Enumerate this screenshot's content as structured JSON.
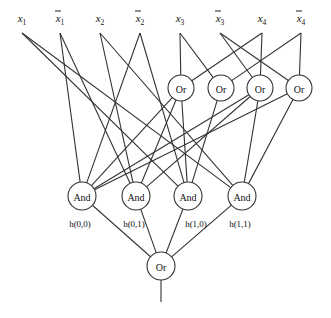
{
  "diagram": {
    "type": "logic-circuit",
    "inputs": [
      {
        "id": "x1",
        "base": "x",
        "sub": "1",
        "negated": false,
        "x": 22
      },
      {
        "id": "nx1",
        "base": "x",
        "sub": "1",
        "negated": true,
        "x": 60
      },
      {
        "id": "x2",
        "base": "x",
        "sub": "2",
        "negated": false,
        "x": 100
      },
      {
        "id": "nx2",
        "base": "x",
        "sub": "2",
        "negated": true,
        "x": 140
      },
      {
        "id": "x3",
        "base": "x",
        "sub": "3",
        "negated": false,
        "x": 180
      },
      {
        "id": "nx3",
        "base": "x",
        "sub": "3",
        "negated": true,
        "x": 220
      },
      {
        "id": "x4",
        "base": "x",
        "sub": "4",
        "negated": false,
        "x": 262
      },
      {
        "id": "nx4",
        "base": "x",
        "sub": "4",
        "negated": true,
        "x": 301
      }
    ],
    "or_gates": [
      {
        "id": "or1",
        "label": "Or",
        "x": 181,
        "y": 88
      },
      {
        "id": "or2",
        "label": "Or",
        "x": 221,
        "y": 88
      },
      {
        "id": "or3",
        "label": "Or",
        "x": 260,
        "y": 88
      },
      {
        "id": "or4",
        "label": "Or",
        "x": 299,
        "y": 88
      }
    ],
    "and_gates": [
      {
        "id": "and00",
        "label": "And",
        "x": 82,
        "y": 196,
        "output_label": "h(0,0)"
      },
      {
        "id": "and01",
        "label": "And",
        "x": 136,
        "y": 196,
        "output_label": "h(0,1)"
      },
      {
        "id": "and10",
        "label": "And",
        "x": 188,
        "y": 196,
        "output_label": "h(1,0)"
      },
      {
        "id": "and11",
        "label": "And",
        "x": 242,
        "y": 196,
        "output_label": "h(1,1)"
      }
    ],
    "output_gate": {
      "id": "orOut",
      "label": "Or",
      "x": 161,
      "y": 266
    },
    "edges": [
      [
        "x1",
        "and10"
      ],
      [
        "x1",
        "and11"
      ],
      [
        "nx1",
        "and00"
      ],
      [
        "nx1",
        "and01"
      ],
      [
        "x2",
        "and01"
      ],
      [
        "x2",
        "and11"
      ],
      [
        "nx2",
        "and00"
      ],
      [
        "nx2",
        "and10"
      ],
      [
        "x3",
        "or1"
      ],
      [
        "x3",
        "or2"
      ],
      [
        "nx3",
        "or3"
      ],
      [
        "nx3",
        "or4"
      ],
      [
        "x4",
        "or1"
      ],
      [
        "x4",
        "or3"
      ],
      [
        "nx4",
        "or2"
      ],
      [
        "nx4",
        "or4"
      ],
      [
        "or1",
        "and00"
      ],
      [
        "or1",
        "and01"
      ],
      [
        "or1",
        "and10"
      ],
      [
        "or2",
        "and10"
      ],
      [
        "or3",
        "and00"
      ],
      [
        "or3",
        "and01"
      ],
      [
        "or3",
        "and11"
      ],
      [
        "or4",
        "and00"
      ],
      [
        "or4",
        "and11"
      ],
      [
        "and00",
        "orOut"
      ],
      [
        "and01",
        "orOut"
      ],
      [
        "and10",
        "orOut"
      ],
      [
        "and11",
        "orOut"
      ]
    ]
  }
}
